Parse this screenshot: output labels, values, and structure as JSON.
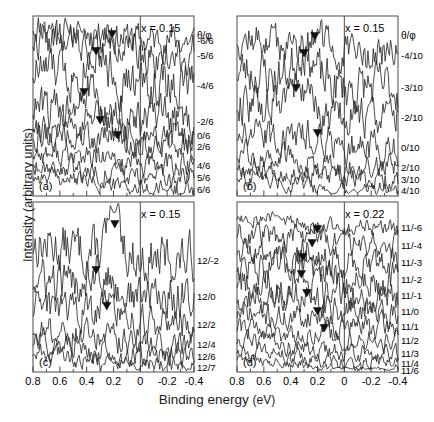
{
  "figure": {
    "axes": {
      "xlabel_main": "Binding energy",
      "xlabel_unit": "(eV)",
      "ylabel": "Intensity (arbitrary units)",
      "xticks": [
        "0.8",
        "0.6",
        "0.4",
        "0.2",
        "0",
        "-0.2",
        "-0.4"
      ],
      "xtick_values": [
        0.8,
        0.6,
        0.4,
        0.2,
        0.0,
        -0.2,
        -0.4
      ],
      "xlim": [
        0.8,
        -0.4
      ],
      "minor_tick_values": [
        0.7,
        0.5,
        0.3,
        0.1,
        -0.1,
        -0.3
      ],
      "fermi_level_value": 0.0
    },
    "panels": [
      {
        "tag": "(a)",
        "concentration": "x = 0.15",
        "angle_header": "θ/φ",
        "series": [
          "-6/6",
          "-5/6",
          "-4/6",
          "-2/6",
          "0/6",
          "2/6",
          "4/6",
          "5/6",
          "6/6"
        ]
      },
      {
        "tag": "(b)",
        "concentration": "x = 0.15",
        "angle_header": "θ/φ",
        "series": [
          "-4/10",
          "-3/10",
          "-2/10",
          "0/10",
          "2/10",
          "3/10",
          "4/10"
        ]
      },
      {
        "tag": "(c)",
        "concentration": "x = 0.15",
        "angle_header": "",
        "series": [
          "12/-2",
          "12/0",
          "12/2",
          "12/4",
          "12/6",
          "12/7"
        ]
      },
      {
        "tag": "(d)",
        "concentration": "x = 0.22",
        "angle_header": "",
        "series": [
          "11/-6",
          "11/-4",
          "11/-3",
          "11/-2",
          "11/-1",
          "11/0",
          "11/1",
          "11/2",
          "11/3",
          "11/4",
          "11/6"
        ]
      }
    ]
  },
  "chart_data": {
    "type": "line",
    "title": "",
    "xlabel": "Binding energy (eV)",
    "ylabel": "Intensity (arbitrary units)",
    "xlim": [
      0.8,
      -0.4
    ],
    "grid": false,
    "legend": "right-side series labels",
    "panels": [
      {
        "tag": "(a)",
        "annotation": "x = 0.15",
        "angle_header": "θ/φ",
        "series": [
          {
            "name": "-6/6",
            "peak_marker_eV": null
          },
          {
            "name": "-5/6",
            "peak_marker_eV": 0.21
          },
          {
            "name": "-4/6",
            "peak_marker_eV": 0.33
          },
          {
            "name": "-2/6",
            "peak_marker_eV": 0.42
          },
          {
            "name": "0/6",
            "peak_marker_eV": 0.3
          },
          {
            "name": "2/6",
            "peak_marker_eV": 0.17
          },
          {
            "name": "4/6",
            "peak_marker_eV": null
          },
          {
            "name": "5/6",
            "peak_marker_eV": null
          },
          {
            "name": "6/6",
            "peak_marker_eV": null
          }
        ]
      },
      {
        "tag": "(b)",
        "annotation": "x = 0.15",
        "angle_header": "θ/φ",
        "series": [
          {
            "name": "-4/10",
            "peak_marker_eV": 0.22
          },
          {
            "name": "-3/10",
            "peak_marker_eV": 0.3
          },
          {
            "name": "-2/10",
            "peak_marker_eV": 0.36
          },
          {
            "name": "0/10",
            "peak_marker_eV": 0.2
          },
          {
            "name": "2/10",
            "peak_marker_eV": null
          },
          {
            "name": "3/10",
            "peak_marker_eV": null
          },
          {
            "name": "4/10",
            "peak_marker_eV": null
          }
        ]
      },
      {
        "tag": "(c)",
        "annotation": "x = 0.15",
        "angle_header": "",
        "series": [
          {
            "name": "12/-2",
            "peak_marker_eV": 0.19
          },
          {
            "name": "12/0",
            "peak_marker_eV": 0.33
          },
          {
            "name": "12/2",
            "peak_marker_eV": 0.25
          },
          {
            "name": "12/4",
            "peak_marker_eV": null
          },
          {
            "name": "12/6",
            "peak_marker_eV": null
          },
          {
            "name": "12/7",
            "peak_marker_eV": null
          }
        ]
      },
      {
        "tag": "(d)",
        "annotation": "x = 0.22",
        "angle_header": "",
        "series": [
          {
            "name": "11/-6",
            "peak_marker_eV": null
          },
          {
            "name": "11/-4",
            "peak_marker_eV": 0.2
          },
          {
            "name": "11/-3",
            "peak_marker_eV": 0.24
          },
          {
            "name": "11/-2",
            "peak_marker_eV": 0.31
          },
          {
            "name": "11/-1",
            "peak_marker_eV": 0.32
          },
          {
            "name": "11/0",
            "peak_marker_eV": 0.28
          },
          {
            "name": "11/1",
            "peak_marker_eV": 0.2
          },
          {
            "name": "11/2",
            "peak_marker_eV": 0.15
          },
          {
            "name": "11/3",
            "peak_marker_eV": null
          },
          {
            "name": "11/4",
            "peak_marker_eV": null
          },
          {
            "name": "11/6",
            "peak_marker_eV": null
          }
        ]
      }
    ]
  }
}
